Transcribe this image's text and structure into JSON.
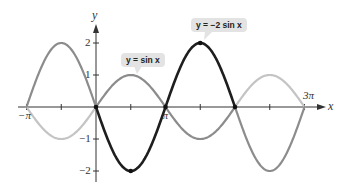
{
  "chart_data": {
    "type": "line",
    "title": "",
    "xlabel": "x",
    "ylabel": "y",
    "xlim": [
      "-π",
      "3π"
    ],
    "ylim": [
      -2.3,
      2.6
    ],
    "grid": false,
    "x_tick_labels": [
      "−π",
      "π",
      "3π"
    ],
    "x_ticks_every": "π/2",
    "y_tick_labels": [
      "2",
      "1",
      "−1",
      "−2"
    ],
    "series": [
      {
        "name": "y = sin x",
        "label": "y = sin x",
        "function": "sin(x)",
        "domain": [
          "-π",
          "3π"
        ],
        "highlight_domain": [
          0,
          "2π"
        ],
        "color_highlight": "#8c8c8c",
        "color_extension": "#c4c4c4",
        "points": [
          [
            -3.1416,
            0
          ],
          [
            -1.5708,
            -1
          ],
          [
            0,
            0
          ],
          [
            1.5708,
            1
          ],
          [
            3.1416,
            0
          ],
          [
            4.7124,
            -1
          ],
          [
            6.2832,
            0
          ],
          [
            7.854,
            1
          ],
          [
            9.4248,
            0
          ]
        ]
      },
      {
        "name": "y = −2 sin x",
        "label": "y = −2 sin x",
        "function": "-2*sin(x)",
        "domain": [
          "-π",
          "3π"
        ],
        "highlight_domain": [
          0,
          "2π"
        ],
        "color_highlight": "#1e1e1e",
        "color_extension": "#8c8c8c",
        "points": [
          [
            -3.1416,
            0
          ],
          [
            -1.5708,
            2
          ],
          [
            0,
            0
          ],
          [
            1.5708,
            -2
          ],
          [
            3.1416,
            0
          ],
          [
            4.7124,
            2
          ],
          [
            6.2832,
            0
          ],
          [
            7.854,
            -2
          ],
          [
            9.4248,
            0
          ]
        ]
      }
    ],
    "marked_points": [
      [
        0,
        0
      ],
      [
        1.5708,
        -2
      ],
      [
        3.1416,
        0
      ],
      [
        4.7124,
        2
      ],
      [
        6.2832,
        0
      ]
    ]
  },
  "labels": {
    "x_axis": "x",
    "y_axis": "y",
    "neg_pi": "−π",
    "pi": "π",
    "three_pi": "3π",
    "y2": "2",
    "y1": "1",
    "ym1": "−1",
    "ym2": "−2",
    "callout_sin": "y = sin x",
    "callout_neg2sin": "y = −2 sin x"
  }
}
